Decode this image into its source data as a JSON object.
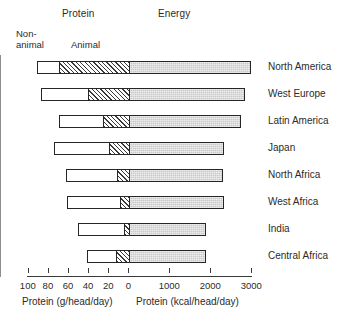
{
  "header": {
    "protein_label": "Protein",
    "energy_label": "Energy"
  },
  "legend": {
    "nonanimal_line1": "Non-",
    "nonanimal_line2": "animal",
    "animal": "Animal"
  },
  "axis": {
    "left_title": "Protein (g/head/day)",
    "right_title": "Protein (kcal/head/day)",
    "tick_labels": [
      "100",
      "80",
      "60",
      "40",
      "20",
      "0",
      "1000",
      "2000",
      "3000"
    ]
  },
  "chart_data": {
    "type": "bar",
    "title": "",
    "subtitle": "",
    "orientation": "horizontal",
    "diverging": true,
    "xlabel_left": "Protein (g/head/day)",
    "xlabel_right": "Protein (kcal/head/day)",
    "ylabel": "",
    "grid": false,
    "legend_position": "top-left",
    "left_axis": {
      "name": "Protein",
      "unit": "g/head/day",
      "direction": "leftward",
      "ticks": [
        100,
        80,
        60,
        40,
        20,
        0
      ],
      "range": [
        100,
        0
      ]
    },
    "right_axis": {
      "name": "Energy",
      "unit": "kcal/head/day",
      "direction": "rightward",
      "ticks": [
        0,
        1000,
        2000,
        3000
      ],
      "range": [
        0,
        3000
      ]
    },
    "legend_entries": [
      "Non-animal",
      "Animal",
      "Energy"
    ],
    "categories": [
      "North America",
      "West Europe",
      "Latin America",
      "Japan",
      "North Africa",
      "West Africa",
      "India",
      "Central Africa"
    ],
    "series": [
      {
        "name": "Non-animal protein",
        "unit": "g/head/day",
        "axis": "left",
        "values": [
          21,
          46,
          43,
          54,
          50,
          52,
          45,
          28
        ]
      },
      {
        "name": "Animal protein",
        "unit": "g/head/day",
        "axis": "left",
        "values": [
          70,
          41,
          26,
          20,
          12,
          9,
          5,
          13
        ]
      },
      {
        "name": "Energy",
        "unit": "kcal/head/day",
        "axis": "right",
        "values": [
          3000,
          2850,
          2760,
          2340,
          2300,
          2340,
          1890,
          1890
        ]
      }
    ],
    "total_protein": [
      91,
      87,
      69,
      74,
      62,
      61,
      50,
      41
    ]
  },
  "colors": {
    "outline": "#262626",
    "nonanimal_fill": "#ffffff",
    "animal_hatch": "#3a3a3a",
    "energy_fill": "#c9c9c9",
    "zero_line": "#8d8d8d",
    "text": "#2b2b2b"
  }
}
